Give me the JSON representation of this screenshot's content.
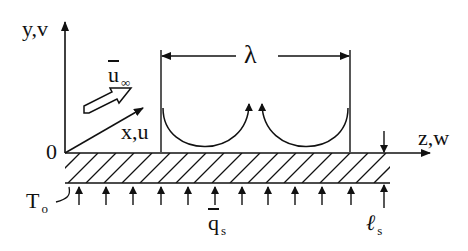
{
  "diagram": {
    "type": "boundary-layer-convection-cells",
    "colors": {
      "stroke": "#111111",
      "background": "#ffffff"
    },
    "axes": {
      "y_label": "y,v",
      "x_label": "x,u",
      "z_label": "z,w",
      "origin_label": "0"
    },
    "flow": {
      "freestream_label_main": "u",
      "freestream_label_sub": "∞"
    },
    "wavelength_label": "λ",
    "wall": {
      "temperature_label_main": "T",
      "temperature_label_sub": "o",
      "heat_flux_label_main": "q",
      "heat_flux_label_sub": "s",
      "thickness_label_main": "ℓ",
      "thickness_label_sub": "s"
    },
    "cells_count": 2,
    "heat_flux_arrows_count": 12
  }
}
